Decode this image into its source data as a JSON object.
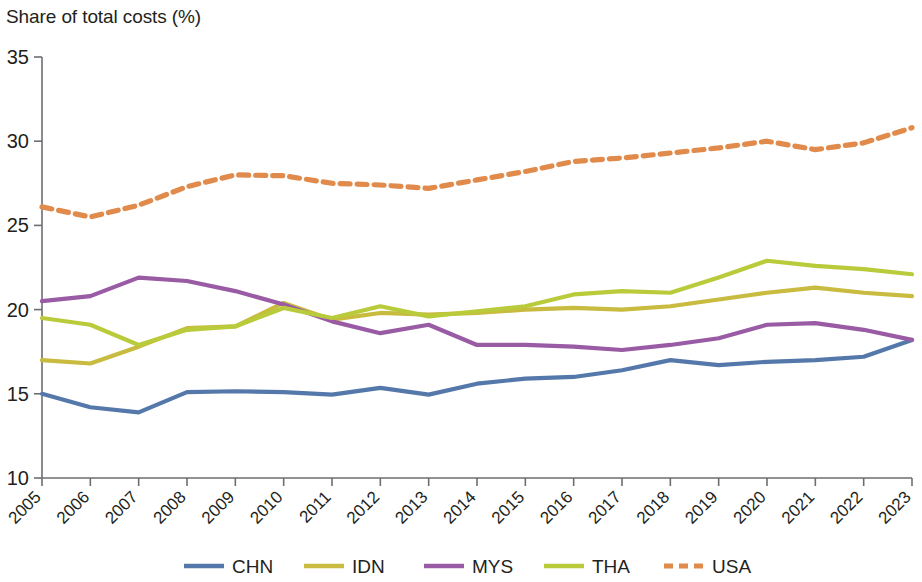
{
  "chart_data": {
    "type": "line",
    "title": "",
    "ylabel": "Share of total costs (%)",
    "xlabel": "",
    "ylim": [
      10,
      35
    ],
    "yticks": [
      10,
      15,
      20,
      25,
      30,
      35
    ],
    "grid": false,
    "legend_position": "bottom",
    "categories": [
      "2005",
      "2006",
      "2007",
      "2008",
      "2009",
      "2010",
      "2011",
      "2012",
      "2013",
      "2014",
      "2015",
      "2016",
      "2017",
      "2018",
      "2019",
      "2020",
      "2021",
      "2022",
      "2023"
    ],
    "series": [
      {
        "name": "CHN",
        "color": "#5578ab",
        "style": "solid",
        "values": [
          15.0,
          14.2,
          13.9,
          15.1,
          15.15,
          15.1,
          14.95,
          15.35,
          14.95,
          15.6,
          15.9,
          16.0,
          16.4,
          17.0,
          16.7,
          16.9,
          17.0,
          17.2,
          18.2
        ]
      },
      {
        "name": "IDN",
        "color": "#c8bb3f",
        "style": "solid",
        "values": [
          17.0,
          16.8,
          17.8,
          18.9,
          19.0,
          20.4,
          19.4,
          19.8,
          19.7,
          19.8,
          20.0,
          20.1,
          20.0,
          20.2,
          20.6,
          21.0,
          21.3,
          21.0,
          20.8
        ]
      },
      {
        "name": "MYS",
        "color": "#9a5ba5",
        "style": "solid",
        "values": [
          20.5,
          20.8,
          21.9,
          21.7,
          21.1,
          20.3,
          19.3,
          18.6,
          19.1,
          17.9,
          17.9,
          17.8,
          17.6,
          17.9,
          18.3,
          19.1,
          19.2,
          18.8,
          18.2
        ]
      },
      {
        "name": "THA",
        "color": "#b9cb3a",
        "style": "solid",
        "values": [
          19.5,
          19.1,
          17.9,
          18.8,
          19.0,
          20.1,
          19.5,
          20.2,
          19.6,
          19.9,
          20.2,
          20.9,
          21.1,
          21.0,
          21.9,
          22.9,
          22.6,
          22.4,
          22.1
        ]
      },
      {
        "name": "USA",
        "color": "#e08b4c",
        "style": "dashed",
        "values": [
          26.1,
          25.5,
          26.2,
          27.3,
          28.0,
          27.95,
          27.5,
          27.4,
          27.2,
          27.7,
          28.2,
          28.8,
          29.0,
          29.3,
          29.6,
          30.0,
          29.5,
          29.9,
          30.8
        ]
      }
    ]
  },
  "legend": {
    "items": [
      {
        "label": "CHN",
        "color": "#5578ab",
        "style": "solid"
      },
      {
        "label": "IDN",
        "color": "#c8bb3f",
        "style": "solid"
      },
      {
        "label": "MYS",
        "color": "#9a5ba5",
        "style": "solid"
      },
      {
        "label": "THA",
        "color": "#b9cb3a",
        "style": "solid"
      },
      {
        "label": "USA",
        "color": "#e08b4c",
        "style": "dashed"
      }
    ]
  }
}
